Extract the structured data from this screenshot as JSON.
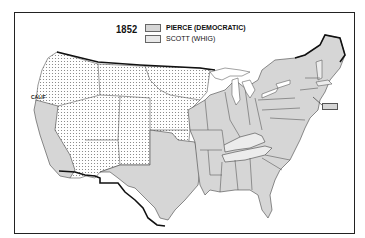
{
  "map": {
    "year": "1852",
    "title": "1852 Presidential Election",
    "legend": [
      {
        "label": "PIERCE (DEMOCRATIC)",
        "fill": "#d6d6d6",
        "pattern": "solid gray"
      },
      {
        "label": "SCOTT (WHIG)",
        "fill": "#e9e9e9",
        "pattern": "light gray"
      }
    ],
    "territories_fill": "dotted white (unorganized territories)",
    "state_labels": [
      "CALIF"
    ],
    "colors": {
      "pierce": "#d6d6d6",
      "scott": "#ececec",
      "territory": "#ffffff",
      "border": "#333333",
      "national_border": "#111111"
    },
    "results": {
      "pierce_states": [
        "California",
        "Texas",
        "Louisiana",
        "Arkansas",
        "Missouri",
        "Iowa",
        "Wisconsin",
        "Michigan",
        "Illinois",
        "Indiana",
        "Ohio",
        "Mississippi",
        "Alabama",
        "Georgia",
        "Florida",
        "South Carolina",
        "North Carolina",
        "Virginia",
        "Maryland",
        "Delaware",
        "Pennsylvania",
        "New Jersey",
        "New York",
        "Connecticut",
        "Rhode Island",
        "New Hampshire",
        "Maine"
      ],
      "scott_states": [
        "Kentucky",
        "Tennessee",
        "Vermont",
        "Massachusetts"
      ]
    }
  }
}
